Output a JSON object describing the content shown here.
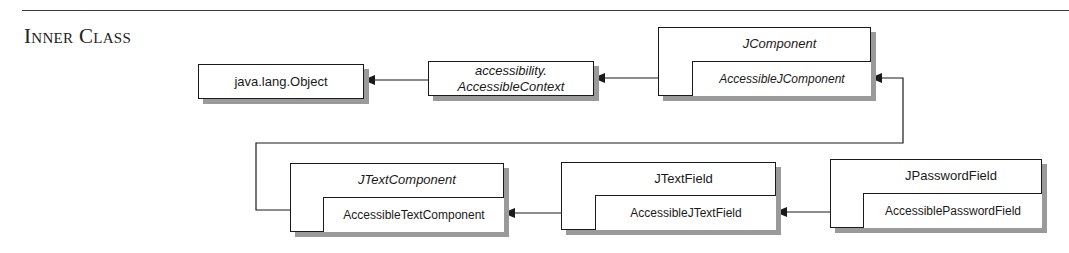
{
  "section": {
    "title": "Inner Class"
  },
  "diagram": {
    "classes": [
      {
        "id": "object",
        "name": "java.lang.Object",
        "abstract": false
      },
      {
        "id": "accessible-context",
        "name_line1": "accessibility.",
        "name_line2": "AccessibleContext",
        "abstract": true
      },
      {
        "id": "jcomponent",
        "name": "JComponent",
        "abstract": true,
        "inner": {
          "name": "AccessibleJComponent",
          "abstract": true
        }
      },
      {
        "id": "jtextcomponent",
        "name": "JTextComponent",
        "abstract": true,
        "inner": {
          "name": "AccessibleTextComponent",
          "abstract": false
        }
      },
      {
        "id": "jtextfield",
        "name": "JTextField",
        "abstract": false,
        "inner": {
          "name": "AccessibleJTextField",
          "abstract": false
        }
      },
      {
        "id": "jpasswordfield",
        "name": "JPasswordField",
        "abstract": false,
        "inner": {
          "name": "AccessiblePasswordField",
          "abstract": false
        }
      }
    ],
    "inheritance": [
      {
        "from": "accessibility.AccessibleContext",
        "to": "java.lang.Object"
      },
      {
        "from": "AccessibleJComponent",
        "to": "accessibility.AccessibleContext"
      },
      {
        "from": "AccessibleTextComponent",
        "to": "AccessibleJComponent"
      },
      {
        "from": "AccessibleJTextField",
        "to": "AccessibleTextComponent"
      },
      {
        "from": "AccessiblePasswordField",
        "to": "AccessibleJTextField"
      }
    ],
    "colors": {
      "line": "#1a1a1a",
      "shadow": "#9a9a9a",
      "background": "#ffffff"
    }
  }
}
